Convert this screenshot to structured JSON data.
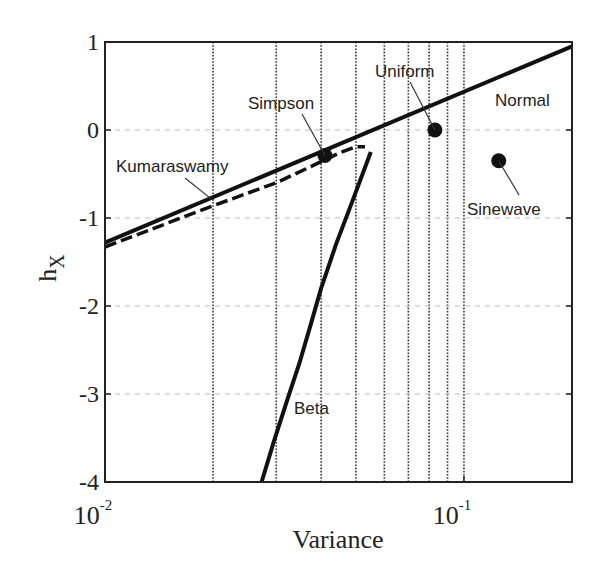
{
  "chart_data": {
    "type": "line",
    "title": "",
    "xlabel": "Variance",
    "ylabel": "h",
    "ylabel_subscript": "X",
    "xscale": "log",
    "xlim": [
      0.01,
      0.2
    ],
    "ylim": [
      -4,
      1
    ],
    "grid": "x minor dotted, y major dashed",
    "x_ticks": [
      {
        "value": 0.01,
        "base": "10",
        "exp": "-2"
      },
      {
        "value": 0.1,
        "base": "10",
        "exp": "-1"
      }
    ],
    "x_minor_gridlines": [
      0.02,
      0.03,
      0.04,
      0.05,
      0.06,
      0.07,
      0.08,
      0.09,
      0.1
    ],
    "y_ticks": [
      {
        "value": 1,
        "label": "1"
      },
      {
        "value": 0,
        "label": "0"
      },
      {
        "value": -1,
        "label": "-1"
      },
      {
        "value": -2,
        "label": "-2"
      },
      {
        "value": -3,
        "label": "-3"
      },
      {
        "value": -4,
        "label": "-4"
      }
    ],
    "series": [
      {
        "name": "Normal",
        "style": "solid",
        "x": [
          0.01,
          0.2
        ],
        "y": [
          -1.28,
          0.95
        ]
      },
      {
        "name": "Kumaraswamy",
        "style": "dashed",
        "x": [
          0.01,
          0.02,
          0.03,
          0.04,
          0.045,
          0.05,
          0.053
        ],
        "y": [
          -1.33,
          -0.86,
          -0.6,
          -0.36,
          -0.26,
          -0.19,
          -0.19
        ]
      },
      {
        "name": "Beta",
        "style": "solid",
        "x": [
          0.0273,
          0.0295,
          0.032,
          0.0348,
          0.0375,
          0.04,
          0.044,
          0.049,
          0.055
        ],
        "y": [
          -4.0,
          -3.55,
          -3.1,
          -2.65,
          -2.2,
          -1.8,
          -1.3,
          -0.8,
          -0.25
        ]
      }
    ],
    "points": [
      {
        "name": "Simpson",
        "x": 0.041,
        "y": -0.29
      },
      {
        "name": "Uniform",
        "x": 0.083,
        "y": 0.0
      },
      {
        "name": "Sinewave",
        "x": 0.125,
        "y": -0.35
      }
    ],
    "annotations": [
      {
        "text": "Kumaraswamy",
        "target": "Kumaraswamy"
      },
      {
        "text": "Simpson",
        "target": "Simpson"
      },
      {
        "text": "Uniform",
        "target": "Uniform"
      },
      {
        "text": "Normal",
        "target": "Normal"
      },
      {
        "text": "Sinewave",
        "target": "Sinewave"
      },
      {
        "text": "Beta",
        "target": "Beta"
      }
    ]
  }
}
